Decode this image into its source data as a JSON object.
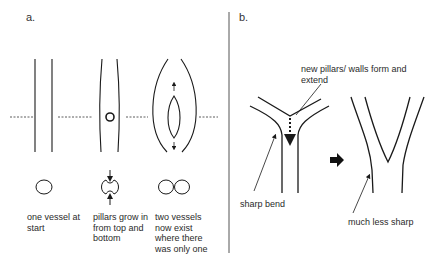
{
  "panel_a": {
    "label": "a.",
    "steps": [
      {
        "caption": "one vessel at\nstart"
      },
      {
        "caption": "pillars grow in\nfrom top and\nbottom"
      },
      {
        "caption": "two vessels\nnow exist\nwhere there\nwas only one"
      }
    ]
  },
  "panel_b": {
    "label": "b.",
    "annotations": {
      "new_pillars": "new pillars/ walls form and\nextend",
      "sharp_bend": "sharp bend",
      "less_sharp": "much less sharp"
    }
  },
  "colors": {
    "stroke": "#1a1a1a",
    "divider": "#555555",
    "background": "#ffffff"
  }
}
